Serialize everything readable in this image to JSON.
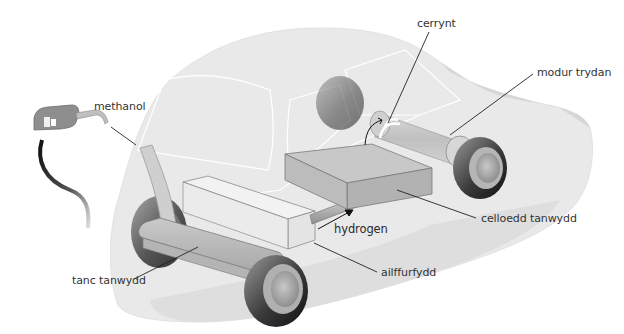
{
  "diagram": {
    "labels": {
      "methanol": "methanol",
      "cerrynt": "cerrynt",
      "modur_trydan": "modur trydan",
      "celloedd_tanwydd": "celloedd tanwydd",
      "hydrogen": "hydrogen",
      "ailffurfydd": "ailffurfydd",
      "tanc_tanwydd": "tanc tanwydd"
    },
    "colors": {
      "car_body": "#e9e9e9",
      "car_shadow": "#dcdcdc",
      "component_box": "#bdbdbd",
      "reformer_box": "#efefef",
      "tyre": "#1a1a1a",
      "leader_line": "#222222",
      "label_text": "#333333"
    }
  }
}
